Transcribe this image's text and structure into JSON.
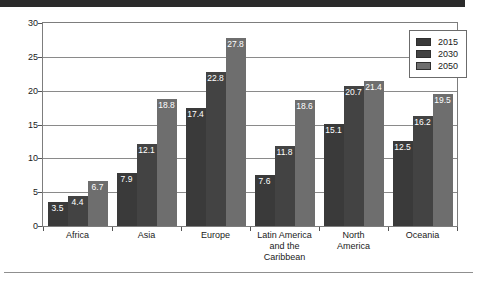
{
  "banner": {
    "present": true,
    "color": "#2b2b2b"
  },
  "footer_rule": {
    "present": true,
    "color": "#8f8f8f"
  },
  "legend": {
    "position": "top-right",
    "entries": [
      {
        "label": "2015",
        "color": "#3a3a3a"
      },
      {
        "label": "2030",
        "color": "#434343"
      },
      {
        "label": "2050",
        "color": "#6e6e6e"
      }
    ]
  },
  "chart_data": {
    "type": "bar",
    "title": "",
    "xlabel": "",
    "ylabel": "Percentage",
    "ylim": [
      0,
      30
    ],
    "yticks": [
      0,
      5,
      10,
      15,
      20,
      25,
      30
    ],
    "grid": true,
    "legend_position": "top-right",
    "categories": [
      "Africa",
      "Asia",
      "Europe",
      "Latin America and the Caribbean",
      "North America",
      "Oceania"
    ],
    "category_lines": [
      [
        "Africa"
      ],
      [
        "Asia"
      ],
      [
        "Europe"
      ],
      [
        "Latin America",
        "and the",
        "Caribbean"
      ],
      [
        "North",
        "America"
      ],
      [
        "Oceania"
      ]
    ],
    "series": [
      {
        "name": "2015",
        "color": "#3a3a3a",
        "values": [
          3.5,
          7.9,
          17.4,
          7.6,
          15.1,
          12.5
        ]
      },
      {
        "name": "2030",
        "color": "#434343",
        "values": [
          4.4,
          12.1,
          22.8,
          11.8,
          20.7,
          16.2
        ]
      },
      {
        "name": "2050",
        "color": "#6e6e6e",
        "values": [
          6.7,
          18.8,
          27.8,
          18.6,
          21.4,
          19.5
        ]
      }
    ]
  }
}
